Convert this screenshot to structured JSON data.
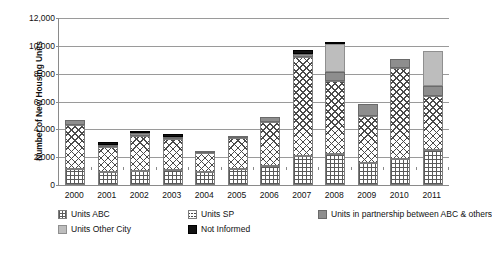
{
  "chart_data": {
    "type": "bar",
    "subtype": "stacked-column",
    "title": "",
    "xlabel": "",
    "ylabel": "Number of New Housing Units",
    "ylim": [
      0,
      12000
    ],
    "ytick_step": 2000,
    "ytick_labels": [
      "0",
      "2,000",
      "4,000",
      "6,000",
      "8,000",
      "10,000",
      "12,000"
    ],
    "ytick_values": [
      0,
      2000,
      4000,
      6000,
      8000,
      10000,
      12000
    ],
    "grid": true,
    "legend_position": "bottom",
    "categories": [
      "2000",
      "2001",
      "2002",
      "2003",
      "2004",
      "2005",
      "2006",
      "2007",
      "2008",
      "2009",
      "2010",
      "2011"
    ],
    "series": [
      {
        "name": "Units ABC",
        "pattern": "dotted-grid",
        "color": "#ffffff",
        "values": [
          1150,
          900,
          1000,
          1100,
          950,
          1150,
          1350,
          2100,
          2250,
          1550,
          1900,
          2500
        ]
      },
      {
        "name": "Units SP",
        "pattern": "cross-hatch",
        "color": "#ffffff",
        "values": [
          3150,
          1850,
          2500,
          2200,
          1350,
          2200,
          3150,
          7100,
          5200,
          3400,
          6500,
          3900
        ]
      },
      {
        "name": "Units in partnership between ABC & others",
        "pattern": "solid",
        "color": "#8e8e8e",
        "values": [
          400,
          150,
          250,
          150,
          150,
          200,
          400,
          250,
          700,
          850,
          650,
          700
        ]
      },
      {
        "name": "Units Other City",
        "pattern": "solid",
        "color": "#bdbdbd",
        "values": [
          0,
          0,
          0,
          0,
          0,
          0,
          0,
          0,
          1950,
          0,
          0,
          2550
        ]
      },
      {
        "name": "Not Informed",
        "pattern": "solid",
        "color": "#121212",
        "values": [
          0,
          200,
          150,
          250,
          0,
          0,
          0,
          250,
          200,
          0,
          0,
          0
        ]
      }
    ]
  },
  "legend": {
    "items": [
      {
        "label": "Units ABC",
        "swatch": "fill-abc"
      },
      {
        "label": "Units SP",
        "swatch": "fill-sp"
      },
      {
        "label": "Units in partnership between ABC & others",
        "swatch": "fill-partner"
      },
      {
        "label": "Units Other City",
        "swatch": "fill-other-city"
      },
      {
        "label": "Not Informed",
        "swatch": "fill-not-informed"
      }
    ]
  }
}
